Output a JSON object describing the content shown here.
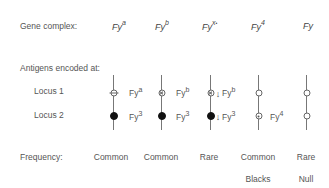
{
  "rows": {
    "gene_complex_label": "Gene complex:",
    "antigens_label": "Antigens encoded at:",
    "locus1_label": "Locus 1",
    "locus2_label": "Locus 2",
    "frequency_label": "Frequency:"
  },
  "columns": [
    {
      "gene_base": "Fy",
      "gene_sup": "a",
      "locus1_symbol": "open-circle-bar",
      "locus1_antigen_base": "Fy",
      "locus1_antigen_sup": "a",
      "locus2_symbol": "filled-circle",
      "locus2_antigen_base": "Fy",
      "locus2_antigen_sup": "3",
      "frequency": "Common",
      "note": ""
    },
    {
      "gene_base": "Fy",
      "gene_sup": "b",
      "locus1_symbol": "circle-x",
      "locus1_antigen_base": "Fy",
      "locus1_antigen_sup": "b",
      "locus2_symbol": "filled-circle",
      "locus2_antigen_base": "Fy",
      "locus2_antigen_sup": "3",
      "frequency": "Common",
      "note": ""
    },
    {
      "gene_base": "Fy",
      "gene_sup": "x",
      "locus1_symbol": "circle-x-arrow",
      "locus1_antigen_base": "Fy",
      "locus1_antigen_sup": "b",
      "locus2_symbol": "filled-circle-arrow",
      "locus2_antigen_base": "Fy",
      "locus2_antigen_sup": "3",
      "arrow": "↓",
      "frequency": "Rare",
      "note": ""
    },
    {
      "gene_base": "Fy",
      "gene_sup": "4",
      "locus1_symbol": "open-circle",
      "locus1_antigen_base": "",
      "locus1_antigen_sup": "",
      "locus2_symbol": "dotted-circle",
      "locus2_antigen_base": "Fy",
      "locus2_antigen_sup": "4",
      "frequency": "Common",
      "note": "Blacks"
    },
    {
      "gene_base": "Fy",
      "gene_sup": "",
      "locus1_symbol": "open-circle",
      "locus1_antigen_base": "",
      "locus1_antigen_sup": "",
      "locus2_symbol": "open-circle",
      "locus2_antigen_base": "",
      "locus2_antigen_sup": "",
      "frequency": "Rare",
      "note": "Null"
    }
  ]
}
